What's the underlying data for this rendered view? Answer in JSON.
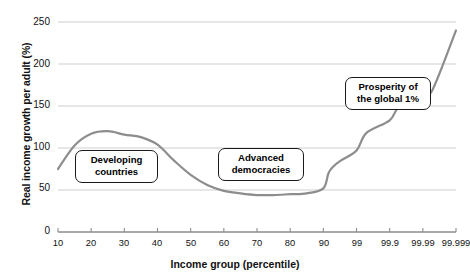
{
  "chart_data": {
    "type": "line",
    "title": "",
    "xlabel": "Income group (percentile)",
    "ylabel": "Real income growth per adult (%)",
    "ylim": [
      0,
      250
    ],
    "yticks": [
      0,
      50,
      100,
      150,
      200,
      250
    ],
    "xticks": [
      "10",
      "20",
      "30",
      "40",
      "50",
      "60",
      "70",
      "80",
      "90",
      "99",
      "99.9",
      "99.99",
      "99.999"
    ],
    "x_scale": "equal-spaced-percentile",
    "grid": "horizontal",
    "legend": "none",
    "series": [
      {
        "name": "Real income growth per adult",
        "color": "#8d8d8d",
        "x": [
          "10",
          "15",
          "20",
          "25",
          "30",
          "35",
          "40",
          "45",
          "50",
          "55",
          "60",
          "65",
          "70",
          "75",
          "80",
          "85",
          "90",
          "93",
          "95",
          "97",
          "99",
          "99.5",
          "99.9",
          "99.95",
          "99.99",
          "99.995",
          "99.999"
        ],
        "values": [
          75,
          103,
          117,
          120,
          116,
          113,
          104,
          85,
          68,
          56,
          49,
          46,
          44,
          44,
          45,
          46,
          52,
          70,
          78,
          85,
          97,
          118,
          133,
          150,
          163,
          170,
          240
        ]
      }
    ],
    "annotations": [
      {
        "id": "developing",
        "label": "Developing\ncountries"
      },
      {
        "id": "advanced",
        "label": "Advanced\ndemocracies"
      },
      {
        "id": "prosperity",
        "label": "Prosperity of\nthe global 1%"
      }
    ],
    "colors": {
      "line": "#8d8d8d",
      "grid": "#cfcfcf",
      "axis": "#8d8d8d",
      "text": "#111111",
      "background": "#ffffff"
    }
  }
}
